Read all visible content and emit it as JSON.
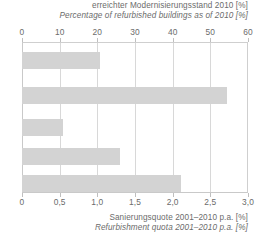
{
  "top_caption": {
    "de": "erreichter Modernisierungsstand 2010 [%]",
    "en": "Percentage of refurbished buildings as of 2010 [%]"
  },
  "bottom_caption": {
    "de": "Sanierungsquote 2001–2010 p.a. [%]",
    "en": "Refurbishment quota 2001–2010 p.a. [%]"
  },
  "colors": {
    "bar_fill": "#d3d3d3",
    "grid": "#d8d8d8",
    "axis": "#c9c9c9",
    "text": "#6b6b6b"
  },
  "chart_data": {
    "type": "bar",
    "orientation": "horizontal",
    "title": "",
    "categories": [
      "1",
      "2",
      "3",
      "4",
      "5"
    ],
    "values": [
      20.7,
      54.4,
      10.9,
      26.0,
      42.2
    ],
    "series": [
      {
        "name": "erreichter Modernisierungsstand 2010 [%]",
        "values": [
          20.7,
          54.4,
          10.9,
          26.0,
          42.2
        ]
      }
    ],
    "xlabel": "erreichter Modernisierungsstand 2010 [%]",
    "xlabel_secondary": "Sanierungsquote 2001–2010 p.a. [%]",
    "ylabel": "",
    "xlim": [
      0,
      60
    ],
    "xlim_secondary": [
      0,
      3.0
    ],
    "grid": true,
    "legend": "none",
    "top_axis": {
      "label_de": "erreichter Modernisierungsstand 2010 [%]",
      "label_en": "Percentage of refurbished buildings as of 2010 [%]",
      "ticks": [
        0,
        10,
        20,
        30,
        40,
        50,
        60
      ],
      "tick_labels": [
        "0",
        "10",
        "20",
        "30",
        "40",
        "50",
        "60"
      ],
      "min": 0,
      "max": 60
    },
    "bottom_axis": {
      "label_de": "Sanierungsquote 2001–2010 p.a. [%]",
      "label_en": "Refurbishment quota 2001–2010 p.a. [%]",
      "ticks": [
        0,
        0.5,
        1.0,
        1.5,
        2.0,
        2.5,
        3.0
      ],
      "tick_labels": [
        "0",
        "0,5",
        "1,0",
        "1,5",
        "2,0",
        "2,5",
        "3,0"
      ],
      "min": 0,
      "max": 3.0
    },
    "bar_layout": [
      {
        "index": 0,
        "value": 20.7,
        "top_pct": 6.6,
        "height_pct": 11.3
      },
      {
        "index": 1,
        "value": 54.4,
        "top_pct": 29.8,
        "height_pct": 11.3
      },
      {
        "index": 2,
        "value": 10.9,
        "top_pct": 51.0,
        "height_pct": 11.3
      },
      {
        "index": 3,
        "value": 26.0,
        "top_pct": 70.2,
        "height_pct": 11.3
      },
      {
        "index": 4,
        "value": 42.2,
        "top_pct": 88.1,
        "height_pct": 11.3
      }
    ]
  }
}
